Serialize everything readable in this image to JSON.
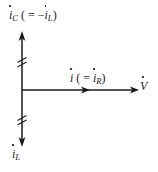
{
  "figure": {
    "kind": "phasor-diagram",
    "background_color": "#ffffff",
    "line_color": "#1a1a1a",
    "text_color": "#1a1a1a"
  },
  "labels": {
    "capacitive_current": {
      "symbol": "i",
      "subscript": "C",
      "relation_open": "( =",
      "relation_sign": "−",
      "relation_symbol": "i",
      "relation_subscript": "L",
      "relation_close": ")",
      "full_text": "i̇C ( = −i̇L )"
    },
    "total_current": {
      "symbol": "i",
      "subscript": "",
      "relation_open": "( =",
      "relation_sign": "",
      "relation_symbol": "i",
      "relation_subscript": "R",
      "relation_close": ")",
      "full_text": "i̇ ( = i̇R )"
    },
    "inductive_current": {
      "symbol": "i",
      "subscript": "L",
      "full_text": "i̇L"
    },
    "voltage": {
      "symbol": "V",
      "subscript": "",
      "full_text": "V̇"
    }
  },
  "axes": {
    "vertical": {
      "name": "current-axis",
      "x": 22,
      "y_top": 32,
      "y_bottom": 146,
      "arrow_top": true,
      "arrow_bottom": true,
      "break_marks": [
        60,
        118
      ]
    },
    "horizontal": {
      "name": "voltage-axis",
      "y": 90,
      "x_left": 22,
      "x_right": 137,
      "arrow_right": true,
      "mid_arrow_x": 86
    }
  }
}
